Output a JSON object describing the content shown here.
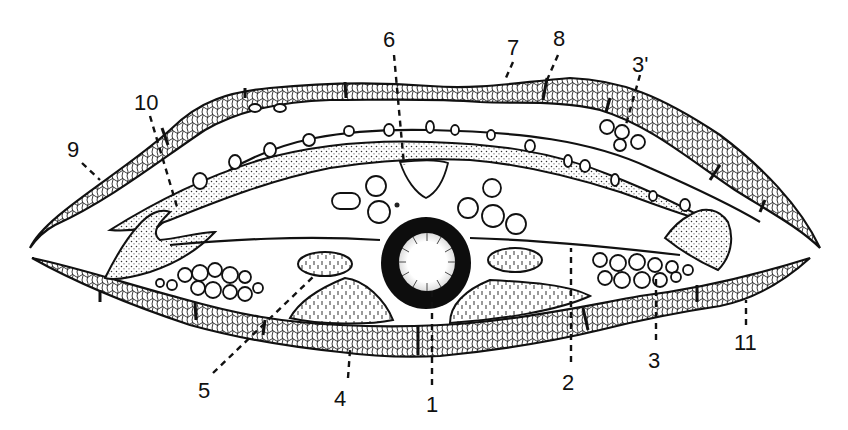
{
  "figure": {
    "type": "anatomical cross-section",
    "labels": [
      {
        "id": "1",
        "text": "1",
        "x": 432,
        "y": 405
      },
      {
        "id": "2",
        "text": "2",
        "x": 568,
        "y": 384
      },
      {
        "id": "3",
        "text": "3",
        "x": 654,
        "y": 362
      },
      {
        "id": "3prime",
        "text": "3'",
        "x": 653,
        "y": 66
      },
      {
        "id": "4",
        "text": "4",
        "x": 340,
        "y": 400
      },
      {
        "id": "5",
        "text": "5",
        "x": 205,
        "y": 393
      },
      {
        "id": "6",
        "text": "6",
        "x": 390,
        "y": 45
      },
      {
        "id": "7",
        "text": "7",
        "x": 512,
        "y": 52
      },
      {
        "id": "8",
        "text": "8",
        "x": 561,
        "y": 45
      },
      {
        "id": "9",
        "text": "9",
        "x": 75,
        "y": 157
      },
      {
        "id": "10",
        "text": "10",
        "x": 148,
        "y": 108
      },
      {
        "id": "11",
        "text": "11",
        "x": 745,
        "y": 347
      }
    ],
    "colors": {
      "ink": "#111111",
      "paper": "#ffffff"
    }
  }
}
